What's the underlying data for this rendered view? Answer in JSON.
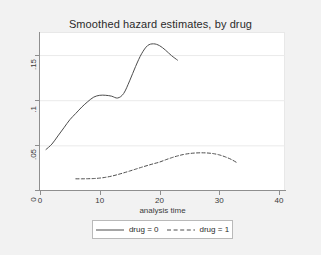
{
  "chart_data": {
    "type": "line",
    "title": "Smoothed hazard estimates, by drug",
    "xlabel": "analysis time",
    "ylabel": "",
    "xlim": [
      0,
      41
    ],
    "ylim": [
      0,
      0.175
    ],
    "xticks": [
      "0",
      "10",
      "20",
      "30",
      "40"
    ],
    "xtick_values": [
      0,
      10,
      20,
      30,
      40
    ],
    "yticks": [
      "0",
      ".05",
      ".1",
      ".15"
    ],
    "ytick_values": [
      0,
      0.05,
      0.1,
      0.15
    ],
    "grid": "horizontal",
    "legend_position": "bottom",
    "series": [
      {
        "name": "drug = 0",
        "style": "solid",
        "color": "#4d4d4d",
        "x": [
          1.0,
          2.0,
          3.0,
          4.0,
          5.0,
          6.0,
          7.0,
          8.0,
          9.0,
          10.0,
          11.0,
          12.0,
          13.0,
          14.0,
          15.0,
          16.0,
          17.0,
          18.0,
          19.0,
          20.0,
          21.0,
          22.0,
          23.0
        ],
        "y": [
          0.046,
          0.052,
          0.061,
          0.07,
          0.079,
          0.086,
          0.093,
          0.099,
          0.104,
          0.106,
          0.106,
          0.105,
          0.103,
          0.108,
          0.122,
          0.138,
          0.152,
          0.161,
          0.163,
          0.161,
          0.156,
          0.15,
          0.145
        ]
      },
      {
        "name": "drug = 1",
        "style": "dashed",
        "color": "#4d4d4d",
        "x": [
          6.0,
          7.0,
          8.0,
          9.0,
          10.0,
          11.0,
          12.0,
          13.0,
          14.0,
          15.0,
          16.0,
          17.0,
          18.0,
          19.0,
          20.0,
          21.0,
          22.0,
          23.0,
          24.0,
          25.0,
          26.0,
          27.0,
          28.0,
          29.0,
          30.0,
          31.0,
          32.0,
          33.0
        ],
        "y": [
          0.0135,
          0.0135,
          0.0136,
          0.0138,
          0.0143,
          0.0152,
          0.0165,
          0.0182,
          0.0201,
          0.0221,
          0.0242,
          0.0263,
          0.0283,
          0.0302,
          0.032,
          0.0345,
          0.0368,
          0.0388,
          0.0404,
          0.0415,
          0.0421,
          0.0423,
          0.0421,
          0.0414,
          0.04,
          0.0378,
          0.035,
          0.0312
        ]
      }
    ]
  },
  "legend": {
    "entries": [
      {
        "label": "drug = 0"
      },
      {
        "label": "drug = 1"
      }
    ]
  }
}
